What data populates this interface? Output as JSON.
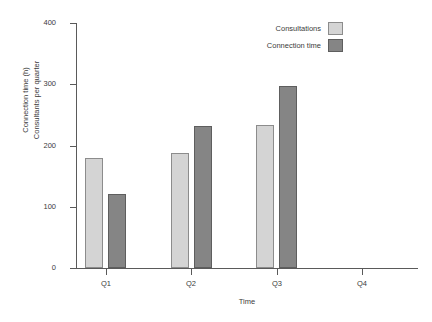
{
  "chart_data": {
    "type": "bar",
    "title": "",
    "categories": [
      "Q1",
      "Q2",
      "Q3",
      "Q4"
    ],
    "series": [
      {
        "name": "Consultations",
        "values": [
          180,
          188,
          233,
          null
        ],
        "color": "#d4d4d4"
      },
      {
        "name": "Connection time",
        "values": [
          121,
          232,
          297,
          null
        ],
        "color": "#858585"
      }
    ],
    "xlabel": "Time",
    "ylabel": "Connection time (h)",
    "ylabel_line2": "Consultants per quarter",
    "ylim": [
      0,
      400
    ],
    "yticks": [
      0,
      100,
      200,
      300,
      400
    ],
    "ytick_labels": [
      "0",
      "100",
      "200",
      "300",
      "400"
    ],
    "grid": false,
    "legend_position": "top-right"
  },
  "axis": {
    "y_title_line1": "Connection time (h)",
    "y_title_line2": "Consultants per quarter",
    "x_title": "Time"
  },
  "legend": {
    "entries": [
      {
        "label": "Consultations"
      },
      {
        "label": "Connection time"
      }
    ]
  },
  "colors": {
    "series_light": "#d4d4d4",
    "series_light_border": "#8c8c8c",
    "series_dark": "#858585",
    "series_dark_border": "#5e5e5e",
    "axis": "#5a5a5a",
    "text": "#3b3b3b",
    "background": "#ffffff"
  }
}
